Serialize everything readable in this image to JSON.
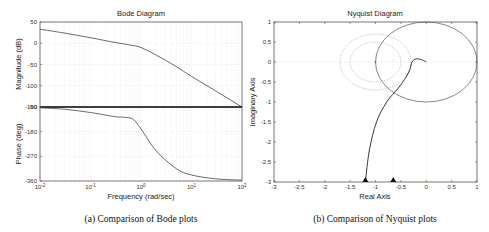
{
  "chart_data": [
    {
      "type": "line",
      "title": "Bode Diagram",
      "caption": "(a) Comparison of Bode plots",
      "xlabel": "Frequency (rad/sec)",
      "xscale": "log",
      "xlim": [
        0.01,
        100
      ],
      "x_ticks": [
        "10^-2",
        "10^-1",
        "10^0",
        "10^1",
        "10^2"
      ],
      "grid": true,
      "subplots": [
        {
          "name": "magnitude",
          "ylabel": "Magnitude (dB)",
          "ylim": [
            -150,
            50
          ],
          "y_ticks": [
            50,
            0,
            -50,
            -100,
            -150
          ],
          "series": [
            {
              "name": "magnitude response",
              "x": [
                0.01,
                0.03,
                0.1,
                0.3,
                0.6,
                1,
                2,
                5,
                10,
                30,
                100
              ],
              "y": [
                33,
                24,
                13,
                2,
                -4,
                -10,
                -28,
                -55,
                -78,
                -112,
                -150
              ]
            }
          ]
        },
        {
          "name": "phase",
          "ylabel": "Phase (deg)",
          "ylim": [
            -360,
            -90
          ],
          "y_ticks": [
            -90,
            -180,
            -270,
            -360
          ],
          "series": [
            {
              "name": "phase response",
              "x": [
                0.01,
                0.03,
                0.1,
                0.3,
                0.5,
                0.7,
                1,
                2,
                5,
                10,
                30,
                100
              ],
              "y": [
                -93,
                -98,
                -110,
                -125,
                -128,
                -135,
                -170,
                -250,
                -315,
                -338,
                -352,
                -357
              ]
            },
            {
              "name": "reference line",
              "x": [
                0.01,
                100
              ],
              "y": [
                -90,
                -90
              ]
            }
          ]
        }
      ],
      "tick_label_note": "The -150 magnitude tick and -90 phase tick overlap at the shared boundary (rendered as '-150' over '-90')"
    },
    {
      "type": "line",
      "title": "Nyquist Diagram",
      "caption": "(b) Comparison of Nyquist plots",
      "xlabel": "Real Axis",
      "ylabel": "Imaginary Axis",
      "xlim": [
        -3,
        1
      ],
      "ylim": [
        -3,
        1
      ],
      "x_ticks": [
        -3,
        -2.5,
        -2,
        -1.5,
        -1,
        -0.5,
        0,
        0.5,
        1
      ],
      "y_ticks": [
        1,
        0.5,
        0,
        -0.5,
        -1,
        -1.5,
        -2,
        -2.5,
        -3
      ],
      "grid": "zero lines",
      "series": [
        {
          "name": "unit circle",
          "shape": "circle",
          "center": [
            0,
            0
          ],
          "radius": 1,
          "style": "solid"
        },
        {
          "name": "inner dotted circle",
          "shape": "circle",
          "center": [
            -1,
            0
          ],
          "radius": 0.5,
          "style": "dotted"
        },
        {
          "name": "outer dotted circle",
          "shape": "circle",
          "center": [
            -1,
            0
          ],
          "radius": 0.7,
          "style": "dotted"
        },
        {
          "name": "nyquist curve",
          "style": "solid",
          "x": [
            -1.2,
            -1.12,
            -0.98,
            -0.78,
            -0.55,
            -0.4,
            -0.32,
            -0.28,
            -0.2,
            -0.08,
            0
          ],
          "y": [
            -3,
            -2.2,
            -1.5,
            -1.0,
            -0.65,
            -0.38,
            -0.18,
            0.0,
            0.08,
            0.05,
            0
          ]
        }
      ],
      "markers": [
        {
          "x": -1.2,
          "y": -3,
          "shape": "triangle"
        },
        {
          "x": -0.65,
          "y": -3,
          "shape": "triangle"
        }
      ],
      "vertical_gridlines": [
        -0.65,
        0
      ]
    }
  ]
}
